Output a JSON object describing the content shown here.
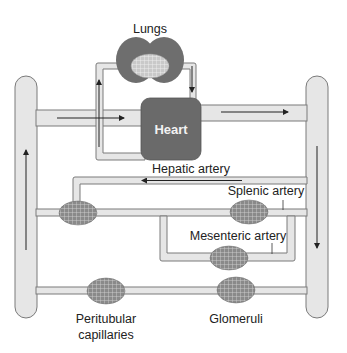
{
  "diagram": {
    "labels": {
      "lungs": "Lungs",
      "heart": "Heart",
      "hepatic_artery": "Hepatic artery",
      "splenic_artery": "Splenic artery",
      "mesenteric_artery": "Mesenteric artery",
      "peritubular_line1": "Peritubular",
      "peritubular_line2": "capillaries",
      "glomeruli": "Glomeruli"
    },
    "colors": {
      "vessel_fill": "#e6e6e6",
      "vessel_stroke": "#7a7a7a",
      "organ_fill": "#6e6e6e",
      "heart_fill": "#6a6a6a",
      "capillary_fill": "#8a8a8a",
      "arrow": "#222222"
    },
    "flow_arrows": [
      "venous-return-into-heart",
      "heart-to-lungs-up",
      "lungs-to-heart-down",
      "aorta-out-right",
      "arterial-down-right",
      "hepatic-artery-left",
      "venous-up-left"
    ],
    "capillary_beds": [
      "lungs",
      "liver",
      "spleen",
      "intestine",
      "peritubular-capillaries",
      "glomeruli"
    ]
  }
}
